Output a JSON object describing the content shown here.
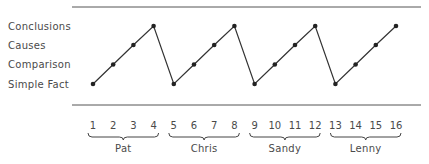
{
  "chart_data": {
    "type": "line",
    "title": "",
    "xlabel": "",
    "ylabel": "",
    "y_categories": [
      "Simple Fact",
      "Comparison",
      "Causes",
      "Conclusions"
    ],
    "x": [
      1,
      2,
      3,
      4,
      5,
      6,
      7,
      8,
      9,
      10,
      11,
      12,
      13,
      14,
      15,
      16
    ],
    "x_tick_labels": [
      "1",
      "2",
      "3",
      "4",
      "5",
      "6",
      "7",
      "8",
      "9",
      "10",
      "11",
      "12",
      "13",
      "14",
      "15",
      "16"
    ],
    "groups": [
      {
        "name": "Pat",
        "x": [
          1,
          2,
          3,
          4
        ]
      },
      {
        "name": "Chris",
        "x": [
          5,
          6,
          7,
          8
        ]
      },
      {
        "name": "Sandy",
        "x": [
          9,
          10,
          11,
          12
        ]
      },
      {
        "name": "Lenny",
        "x": [
          13,
          14,
          15,
          16
        ]
      }
    ],
    "series": [
      {
        "name": "Level of question",
        "values": [
          "Simple Fact",
          "Comparison",
          "Causes",
          "Conclusions",
          "Simple Fact",
          "Comparison",
          "Causes",
          "Conclusions",
          "Simple Fact",
          "Comparison",
          "Causes",
          "Conclusions",
          "Simple Fact",
          "Comparison",
          "Causes",
          "Conclusions"
        ],
        "level_index": [
          0,
          1,
          2,
          3,
          0,
          1,
          2,
          3,
          0,
          1,
          2,
          3,
          0,
          1,
          2,
          3
        ]
      }
    ],
    "grid": false,
    "legend": "none",
    "line_color": "#333333"
  }
}
